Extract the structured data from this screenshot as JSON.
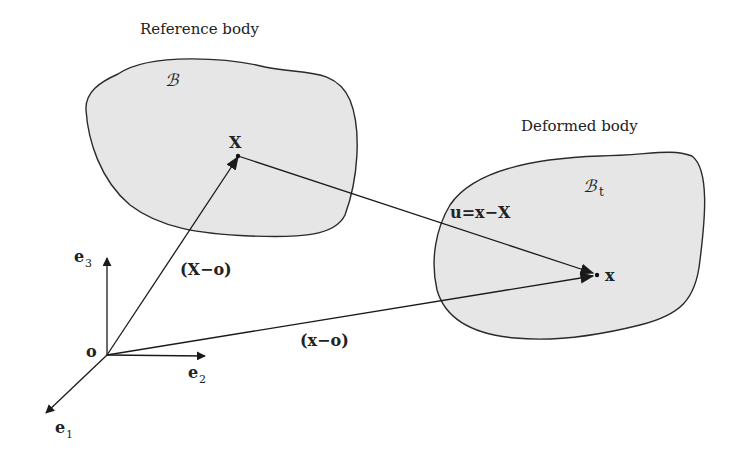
{
  "diagram": {
    "reference_body": {
      "caption": "Reference body",
      "symbol": "ℬ",
      "point_label": "X"
    },
    "deformed_body": {
      "caption": "Deformed body",
      "symbol": "ℬ",
      "symbol_subscript": "t",
      "point_label": "x"
    },
    "vectors": {
      "displacement": "u=x−X",
      "reference_position": "(X−o)",
      "current_position": "(x−o)"
    },
    "axes": {
      "origin": "o",
      "e1": "e",
      "e1_sub": "1",
      "e2": "e",
      "e2_sub": "2",
      "e3": "e",
      "e3_sub": "3"
    },
    "colors": {
      "body_fill": "#e6e6e6",
      "stroke": "#2a2a2a",
      "background": "#ffffff"
    }
  }
}
